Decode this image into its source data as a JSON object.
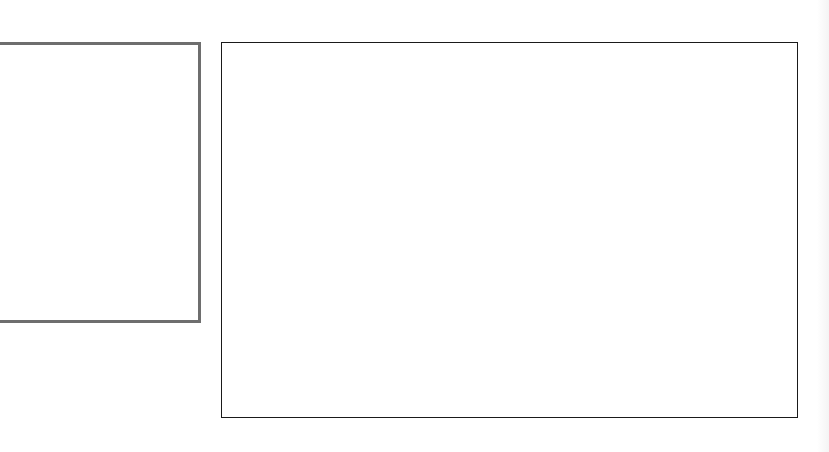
{
  "canvas": {
    "width": 829,
    "height": 452,
    "background": "#ffffff"
  },
  "panels": [
    {
      "id": "left-panel",
      "border_color": "#6e6e6e",
      "border_width": 3,
      "content": ""
    },
    {
      "id": "main-panel",
      "border_color": "#1a1a1a",
      "border_width": 1,
      "content": ""
    }
  ],
  "edge_strip": {
    "color": "#f4f4f4"
  }
}
